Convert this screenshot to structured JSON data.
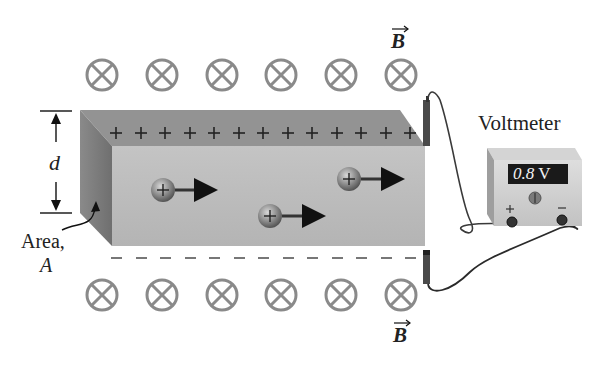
{
  "figure": {
    "field_label": "B",
    "field_symbol_count_per_row": 6,
    "field_symbol": "into-page (circle with X)"
  },
  "labels": {
    "voltmeter_title": "Voltmeter",
    "voltmeter_reading": "0.8 V",
    "voltmeter_reading_value": "0.8",
    "voltmeter_reading_unit": "V",
    "voltmeter_plus_terminal": "+",
    "voltmeter_minus_terminal": "−",
    "dimension_label": "d",
    "area_label_line1": "Area,",
    "area_label_line2": "A",
    "field_label_top": "B",
    "field_label_bottom": "B",
    "charge_symbol": "+"
  },
  "slab": {
    "top_charge_sign": "+",
    "top_charge_count": 13,
    "bottom_charge_sign": "−",
    "bottom_charge_count": 13
  },
  "carriers": [
    {
      "charge": "+",
      "direction": "right"
    },
    {
      "charge": "+",
      "direction": "right"
    },
    {
      "charge": "+",
      "direction": "right"
    }
  ],
  "colors": {
    "slab_front": "#b9b9b9",
    "slab_top": "#8f8f8f",
    "slab_side": "#7d7d7d",
    "field_symbol": "#8a8a8a",
    "voltmeter_display": "#1a1a1a",
    "voltmeter_body": "#c8c8c8",
    "wire": "#333333",
    "text": "#222222"
  }
}
